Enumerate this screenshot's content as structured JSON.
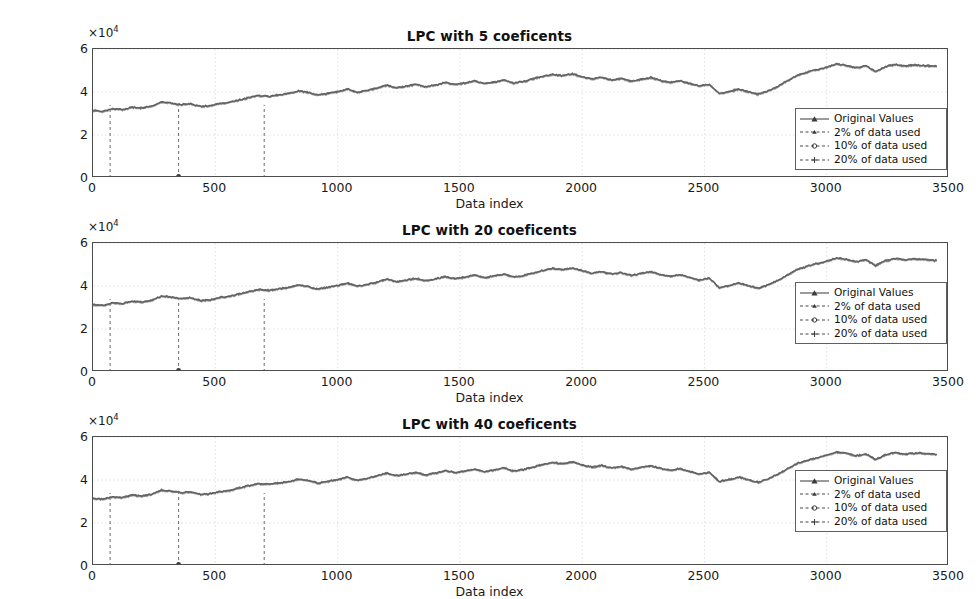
{
  "figure": {
    "background": "#ffffff",
    "line_color": "#6e6e6e",
    "axis_color": "#4d4d4d",
    "grid_color": "#d8d8d8",
    "marker_color": "#3a3a3a"
  },
  "axis_common": {
    "ylabel": "Close value (MXN)",
    "xlabel": "Data index",
    "y_multiplier": "×10",
    "y_multiplier_exp": "4",
    "yticks": [
      0,
      2,
      4,
      6
    ],
    "ytick_labels": [
      "0",
      "2",
      "4",
      "6"
    ],
    "xticks": [
      0,
      500,
      1000,
      1500,
      2000,
      2500,
      3000,
      3500
    ],
    "xtick_labels": [
      "0",
      "500",
      "1000",
      "1500",
      "2000",
      "2500",
      "3000",
      "3500"
    ],
    "xlim": [
      0,
      3500
    ],
    "ylim": [
      0,
      60000
    ],
    "grid": true
  },
  "legend": {
    "position": "southeast",
    "entries": [
      {
        "label": "Original Values",
        "style": "solid",
        "marker": "triangle"
      },
      {
        "label": "2% of data used",
        "style": "dashed",
        "marker": "triangle-small"
      },
      {
        "label": "10% of data used",
        "style": "dashed",
        "marker": "circle"
      },
      {
        "label": "20% of data used",
        "style": "dashed",
        "marker": "plus"
      }
    ]
  },
  "subplots": [
    {
      "id": "sp0",
      "title": "LPC with 5 coeficents"
    },
    {
      "id": "sp1",
      "title": "LPC with 20 coeficents"
    },
    {
      "id": "sp2",
      "title": "LPC with 40 coeficents"
    }
  ],
  "markers": {
    "vertical_lines": [
      {
        "x": 70,
        "style": "dashed",
        "label": "2%-segment-marker"
      },
      {
        "x": 350,
        "style": "dashed",
        "label": "10%-segment-marker",
        "dot_at_zero": true
      },
      {
        "x": 700,
        "style": "dashed",
        "label": "20%-segment-marker"
      }
    ]
  },
  "chart_data": {
    "type": "line",
    "xlabel": "Data index",
    "ylabel": "Close value (MXN)",
    "xlim": [
      0,
      3500
    ],
    "ylim": [
      0,
      60000
    ],
    "y_scale_multiplier": 10000,
    "grid": true,
    "legend_position": "lower right",
    "panels": [
      {
        "title": "LPC with 5 coeficents",
        "series_name": "Original Values"
      },
      {
        "title": "LPC with 20 coeficents",
        "series_name": "Original Values"
      },
      {
        "title": "LPC with 40 coeficents",
        "series_name": "Original Values"
      }
    ],
    "series": [
      {
        "name": "Original Values",
        "x": [
          0,
          40,
          80,
          120,
          160,
          200,
          240,
          280,
          320,
          360,
          400,
          440,
          480,
          520,
          560,
          600,
          640,
          680,
          720,
          760,
          800,
          840,
          880,
          920,
          960,
          1000,
          1040,
          1080,
          1120,
          1160,
          1200,
          1240,
          1280,
          1320,
          1360,
          1400,
          1440,
          1480,
          1520,
          1560,
          1600,
          1640,
          1680,
          1720,
          1760,
          1800,
          1840,
          1880,
          1920,
          1960,
          2000,
          2040,
          2080,
          2120,
          2160,
          2200,
          2240,
          2280,
          2320,
          2360,
          2400,
          2440,
          2480,
          2520,
          2560,
          2600,
          2640,
          2680,
          2720,
          2760,
          2800,
          2840,
          2880,
          2920,
          2960,
          3000,
          3040,
          3080,
          3120,
          3160,
          3200,
          3240,
          3280,
          3320,
          3360,
          3400,
          3450
        ],
        "y": [
          31500,
          31000,
          32200,
          31800,
          33000,
          32600,
          33400,
          35300,
          34900,
          34200,
          34500,
          33300,
          33600,
          34700,
          35200,
          36400,
          37500,
          38400,
          38000,
          38700,
          39300,
          40500,
          39800,
          38600,
          39400,
          40200,
          41400,
          39900,
          40700,
          41900,
          43200,
          42000,
          42700,
          43600,
          42400,
          43300,
          44400,
          43500,
          44200,
          45100,
          43900,
          44700,
          45600,
          44200,
          44900,
          46100,
          47300,
          48200,
          47600,
          48500,
          47100,
          46000,
          46800,
          45600,
          46300,
          45000,
          45900,
          46700,
          45400,
          44500,
          45300,
          44000,
          42800,
          43600,
          39300,
          40200,
          41400,
          40100,
          39000,
          40500,
          42600,
          45300,
          47800,
          49200,
          50400,
          51600,
          53000,
          52400,
          51300,
          52200,
          49500,
          51800,
          52900,
          52100,
          52600,
          52300,
          51900
        ],
        "style": "solid",
        "color": "#6e6e6e"
      }
    ],
    "annotations": [
      {
        "type": "vline",
        "x": 70,
        "style": "dashed",
        "note": "2% of data used boundary"
      },
      {
        "type": "vline",
        "x": 350,
        "style": "dashed",
        "note": "10% of data used boundary"
      },
      {
        "type": "vline",
        "x": 700,
        "style": "dashed",
        "note": "20% of data used boundary"
      }
    ]
  }
}
